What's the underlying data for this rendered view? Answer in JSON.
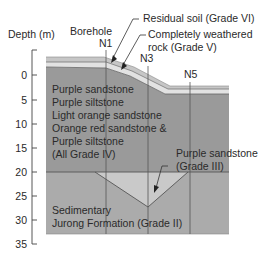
{
  "diagram": {
    "axis": {
      "label": "Depth (m)",
      "ticks": [
        "0",
        "5",
        "10",
        "15",
        "20",
        "25",
        "30",
        "35"
      ]
    },
    "boreholes": {
      "title": "Borehole",
      "items": [
        {
          "name": "N1"
        },
        {
          "name": "N3"
        },
        {
          "name": "N5"
        }
      ]
    },
    "callouts": {
      "residual_soil": "Residual soil (Grade VI)",
      "cw_rock_line1": "Completely weathered",
      "cw_rock_line2": "rock (Grade V)",
      "grade3_line1": "Purple sandstone",
      "grade3_line2": "(Grade III)"
    },
    "layers": {
      "grade4": {
        "lines": [
          "Purple sandstone",
          "Purple siltstone",
          "Light orange sandstone",
          "Orange red sandstone &",
          "Purple siltstone",
          "(All Grade IV)"
        ]
      },
      "grade2": {
        "lines": [
          "Sedimentary",
          "Jurong Formation (Grade II)"
        ]
      }
    },
    "colors": {
      "grade6": "#c4c4c4",
      "grade5": "#dcdcdc",
      "grade4": "#9a9a9a",
      "grade3": "#c8c8c8",
      "grade2": "#ababab",
      "lines": "#555555"
    }
  }
}
